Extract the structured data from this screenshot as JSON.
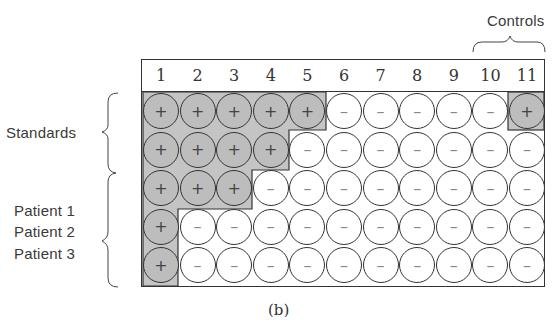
{
  "figure": {
    "caption": "(b)",
    "column_headers": [
      "1",
      "2",
      "3",
      "4",
      "5",
      "6",
      "7",
      "8",
      "9",
      "10",
      "11"
    ],
    "labels": {
      "controls": "Controls",
      "standards": "Standards",
      "patient1": "Patient 1",
      "patient2": "Patient 2",
      "patient3": "Patient 3"
    },
    "symbols": {
      "positive": "+",
      "negative": "–"
    },
    "colors": {
      "positive_fill": "#bdbdbd",
      "negative_fill": "#ffffff",
      "line": "#333333"
    },
    "rows": [
      [
        "+",
        "+",
        "+",
        "+",
        "+",
        "-",
        "-",
        "-",
        "-",
        "-",
        "+"
      ],
      [
        "+",
        "+",
        "+",
        "+",
        "-",
        "-",
        "-",
        "-",
        "-",
        "-",
        "-"
      ],
      [
        "+",
        "+",
        "+",
        "-",
        "-",
        "-",
        "-",
        "-",
        "-",
        "-",
        "-"
      ],
      [
        "+",
        "-",
        "-",
        "-",
        "-",
        "-",
        "-",
        "-",
        "-",
        "-",
        "-"
      ],
      [
        "+",
        "-",
        "-",
        "-",
        "-",
        "-",
        "-",
        "-",
        "-",
        "-",
        "-"
      ]
    ]
  }
}
